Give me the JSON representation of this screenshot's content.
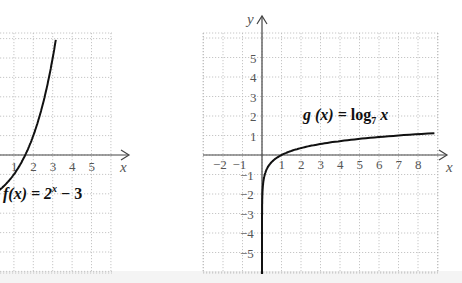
{
  "chart_data": [
    {
      "type": "line",
      "title": "f(x) = 2^x - 3",
      "label_parts": {
        "fx": "f(x) = 2",
        "sup": "x",
        "rest": " − 3"
      },
      "xlabel": "x",
      "ylabel": "",
      "x_ticks": [
        "1",
        "2",
        "3",
        "4",
        "5"
      ],
      "grid": true,
      "series": [
        {
          "name": "f(x) = 2^x - 3",
          "x": [
            -0.5,
            0,
            0.5,
            1,
            1.585,
            2,
            2.5,
            3,
            3.17
          ],
          "y": [
            -2.29,
            -2,
            -1.59,
            -1,
            0,
            1,
            2.66,
            5,
            6.0
          ]
        }
      ]
    },
    {
      "type": "line",
      "title": "g(x) = log_7 x",
      "label_parts": {
        "gx": "g (x) = log",
        "sub": "7",
        "rest": " x"
      },
      "xlabel": "x",
      "ylabel": "y",
      "x_ticks": [
        "−2",
        "−1",
        "1",
        "2",
        "3",
        "4",
        "5",
        "6",
        "7",
        "8"
      ],
      "y_ticks": [
        "5",
        "4",
        "3",
        "2",
        "1",
        "−1",
        "−2",
        "−3",
        "−4",
        "−5"
      ],
      "xlim": [
        -3,
        9
      ],
      "ylim": [
        -6,
        6
      ],
      "grid": true,
      "series": [
        {
          "name": "g(x) = log_7 x",
          "x": [
            0.0002,
            0.01,
            0.1,
            0.5,
            1,
            2,
            3,
            4,
            5,
            6,
            7,
            8,
            9
          ],
          "y": [
            -6,
            -2.37,
            -1.18,
            -0.36,
            0,
            0.36,
            0.56,
            0.71,
            0.83,
            0.92,
            1,
            1.07,
            1.13
          ]
        }
      ]
    }
  ]
}
